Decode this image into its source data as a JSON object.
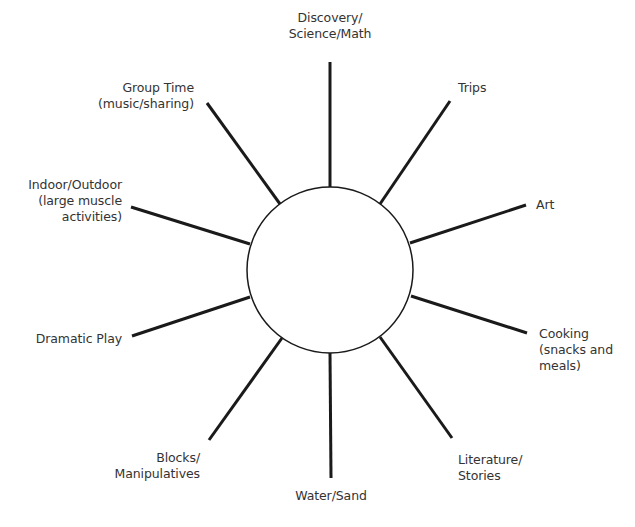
{
  "diagram": {
    "type": "web-diagram",
    "center": {
      "x": 330,
      "y": 270,
      "r": 83
    },
    "stroke_color": "#1a1a1a",
    "spokes": [
      {
        "id": "discovery",
        "x1": 330,
        "y1": 187,
        "x2": 330,
        "y2": 62
      },
      {
        "id": "trips",
        "x1": 380,
        "y1": 204,
        "x2": 450,
        "y2": 101
      },
      {
        "id": "art",
        "x1": 410,
        "y1": 243,
        "x2": 526,
        "y2": 205
      },
      {
        "id": "cooking",
        "x1": 411,
        "y1": 296,
        "x2": 527,
        "y2": 333
      },
      {
        "id": "literature",
        "x1": 380,
        "y1": 337,
        "x2": 452,
        "y2": 438
      },
      {
        "id": "water-sand",
        "x1": 330,
        "y1": 353,
        "x2": 331,
        "y2": 478
      },
      {
        "id": "blocks",
        "x1": 282,
        "y1": 338,
        "x2": 209,
        "y2": 440
      },
      {
        "id": "dramatic-play",
        "x1": 250,
        "y1": 297,
        "x2": 132,
        "y2": 336
      },
      {
        "id": "indoor-outdoor",
        "x1": 250,
        "y1": 244,
        "x2": 131,
        "y2": 207
      },
      {
        "id": "group-time",
        "x1": 280,
        "y1": 204,
        "x2": 207,
        "y2": 103
      }
    ]
  },
  "labels": {
    "discovery": {
      "lines": [
        "Discovery/",
        "Science/Math"
      ]
    },
    "trips": {
      "lines": [
        "Trips"
      ]
    },
    "art": {
      "lines": [
        "Art"
      ]
    },
    "cooking": {
      "lines": [
        "Cooking",
        "(snacks and",
        "meals)"
      ]
    },
    "literature": {
      "lines": [
        "Literature/",
        "Stories"
      ]
    },
    "water_sand": {
      "lines": [
        "Water/Sand"
      ]
    },
    "blocks": {
      "lines": [
        "Blocks/",
        "Manipulatives"
      ]
    },
    "dramatic_play": {
      "lines": [
        "Dramatic Play"
      ]
    },
    "indoor_outdoor": {
      "lines": [
        "Indoor/Outdoor",
        "(large muscle",
        "activities)"
      ]
    },
    "group_time": {
      "lines": [
        "Group Time",
        "(music/sharing)"
      ]
    }
  }
}
